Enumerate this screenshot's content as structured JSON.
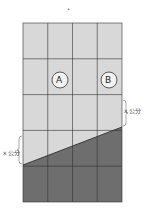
{
  "figure": {
    "top_mark": "•",
    "grid": {
      "columns": 4,
      "rows": 5
    },
    "regions": [
      {
        "id": "A",
        "label": "A",
        "row": 2,
        "column": 2
      },
      {
        "id": "B",
        "label": "B",
        "row": 2,
        "column": 4
      }
    ],
    "dimension_labels": {
      "right": "x 公分",
      "left": "x 公分"
    },
    "colors": {
      "light_fill": "#d8d8d8",
      "dark_fill": "#6e6e6e",
      "grid_line": "#333333",
      "circle_fill": "#f2f2f2"
    }
  }
}
